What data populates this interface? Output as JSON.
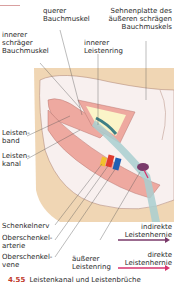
{
  "labels": {
    "querer": "querer\nBauchmuskel",
    "querer_l1": "querer",
    "querer_l2": "Bauchmuskel",
    "sehnen_l1": "Sehnenplatte des",
    "sehnen_l2": "äußeren schrägen",
    "sehnen_l3": "Bauchmuskels",
    "innererSchr_l1": "innerer",
    "innererSchr_l2": "schräger",
    "innererSchr_l3": "Bauchmuskel",
    "innererRing_l1": "innerer",
    "innererRing_l2": "Leistenring",
    "band_l1": "Leisten-",
    "band_l2": "band",
    "kanal_l1": "Leisten-",
    "kanal_l2": "kanal",
    "nerv": "Schenkelnerv",
    "arterie_l1": "Oberschenkel-",
    "arterie_l2": "arterie",
    "vene_l1": "Oberschenkel-",
    "vene_l2": "vene",
    "aeussererRing_l1": "äußerer",
    "aeussererRing_l2": "Leistenring"
  },
  "legend": {
    "indirekt_l1": "indirekte",
    "indirekt_l2": "Leistenhernie",
    "indirekt_color": "#7a3a6a",
    "direkt_l1": "direkte",
    "direkt_l2": "Leistenhernie",
    "direkt_color": "#d6336c"
  },
  "caption": {
    "number": "4.55",
    "text": "Leistenkanal und Leistenbrüche"
  },
  "colors": {
    "skin": "#f0d6b4",
    "muscle": "#eea9a0",
    "aponeurosis": "#f6ecec",
    "nerve": "#f2c12e",
    "artery": "#e03a2e",
    "vein": "#1f5fb3",
    "cord": "#a9cfd0",
    "hernia": "#7a3a6a"
  }
}
